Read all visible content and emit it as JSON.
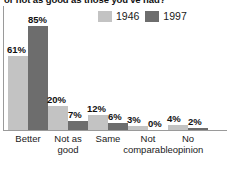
{
  "chart_data": {
    "type": "bar",
    "title": "or not as good as those you've had?",
    "xlabel": "",
    "ylabel": "",
    "ylim": [
      0,
      100
    ],
    "grid": false,
    "legend_position": "top-right",
    "categories": [
      "Better",
      "Not as good",
      "Same",
      "Not comparable",
      "No opinion"
    ],
    "series": [
      {
        "name": "1946",
        "color": "#c3c3c3",
        "values": [
          61,
          20,
          12,
          3,
          4
        ],
        "labels": [
          "61%",
          "20%",
          "12%",
          "3%",
          "4%"
        ]
      },
      {
        "name": "1997",
        "color": "#6d6d6d",
        "values": [
          85,
          7,
          6,
          0,
          2
        ],
        "labels": [
          "85%",
          "7%",
          "6%",
          "0%",
          "2%"
        ]
      }
    ]
  },
  "legend": {
    "entries": [
      {
        "label": "1946",
        "color": "#c3c3c3"
      },
      {
        "label": "1997",
        "color": "#6d6d6d"
      }
    ]
  },
  "axis": {
    "line_color": "#9a9a9a"
  },
  "categories": [
    {
      "line1": "Better",
      "line2": ""
    },
    {
      "line1": "Not as",
      "line2": "good"
    },
    {
      "line1": "Same",
      "line2": ""
    },
    {
      "line1": "Not",
      "line2": "comparable"
    },
    {
      "line1": "No",
      "line2": "opinion"
    }
  ]
}
